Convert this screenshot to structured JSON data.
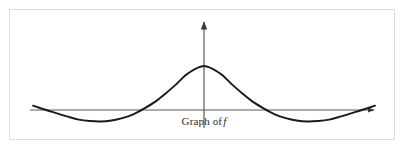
{
  "figure": {
    "caption_prefix": "Graph of",
    "caption_symbol": "f",
    "border_color": "#dedede",
    "background_color": "#ffffff",
    "axis_color": "#59595b",
    "curve_color": "#1a1a1a"
  },
  "chart_data": {
    "type": "line",
    "subtitle": "",
    "xlabel": "",
    "ylabel": "",
    "grid": false,
    "legend": null,
    "axes": {
      "x_axis_y_pixel": 110,
      "y_axis_x_pixel": 204,
      "x_axis_start_pixel": 30,
      "x_axis_end_pixel": 378,
      "y_axis_top_pixel": 18,
      "x_arrow": "right",
      "y_arrow": "up",
      "tick_labels_x": [],
      "tick_labels_y": []
    },
    "xlim": [
      -3.14,
      3.14
    ],
    "ylim": [
      -0.35,
      1.05
    ],
    "x": [
      -3.14,
      -2.9,
      -2.7,
      -2.5,
      -2.3,
      -2.1,
      -1.9,
      -1.7,
      -1.5,
      -1.3,
      -1.1,
      -0.9,
      -0.7,
      -0.5,
      -0.3,
      0.0,
      0.3,
      0.5,
      0.7,
      0.9,
      1.1,
      1.3,
      1.5,
      1.7,
      1.9,
      2.1,
      2.3,
      2.5,
      2.7,
      2.9,
      3.14
    ],
    "values": [
      0.09,
      0.0,
      -0.07,
      -0.14,
      -0.2,
      -0.23,
      -0.24,
      -0.22,
      -0.17,
      -0.09,
      0.03,
      0.17,
      0.35,
      0.55,
      0.76,
      0.92,
      0.76,
      0.55,
      0.35,
      0.17,
      0.03,
      -0.09,
      -0.17,
      -0.22,
      -0.24,
      -0.23,
      -0.2,
      -0.14,
      -0.07,
      0.0,
      0.09
    ],
    "features": {
      "peak": {
        "x": 0.0,
        "y": 0.92,
        "pixel": [
          204,
          66
        ]
      },
      "troughs": [
        {
          "x": -1.9,
          "y": -0.24,
          "pixel": [
            83,
            117
          ]
        },
        {
          "x": 1.9,
          "y": -0.24,
          "pixel": [
            325,
            117
          ]
        }
      ],
      "zero_crossings": [
        -2.9,
        -1.15,
        1.15,
        2.9
      ],
      "zero_crossing_pixels": [
        55,
        127,
        280,
        350
      ]
    }
  }
}
